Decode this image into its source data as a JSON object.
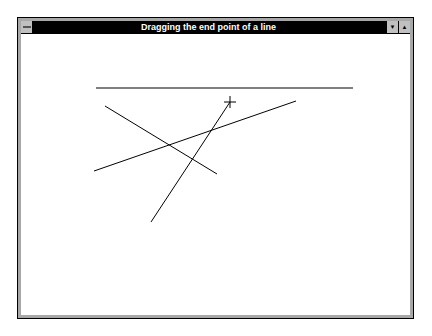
{
  "window": {
    "title": "Dragging the end point of a line",
    "sysmenu_icon": "system-menu-icon",
    "minimize_icon": "▼",
    "maximize_icon": "▲"
  },
  "canvas": {
    "lines": [
      {
        "x1": 96,
        "y1": 88,
        "x2": 353,
        "y2": 88
      },
      {
        "x1": 105,
        "y1": 106,
        "x2": 217,
        "y2": 174
      },
      {
        "x1": 94,
        "y1": 171,
        "x2": 296,
        "y2": 101
      },
      {
        "x1": 151,
        "y1": 222,
        "x2": 230,
        "y2": 102
      }
    ],
    "cursor": {
      "x": 230,
      "y": 102,
      "type": "crosshair"
    },
    "line_color": "#000000"
  }
}
